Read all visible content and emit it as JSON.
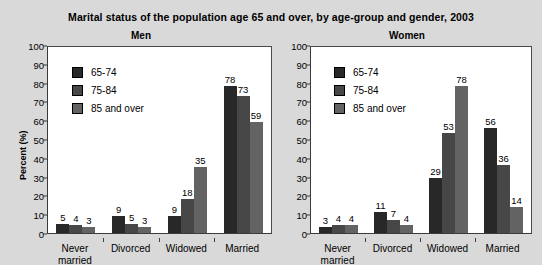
{
  "chart_data": {
    "type": "bar",
    "title": "Marital status of the population age 65 and over, by age-group and gender, 2003",
    "xlabel": "",
    "ylabel": "Percent (%)",
    "ylim": [
      0,
      100
    ],
    "ytick_step": 10,
    "yticks": [
      0,
      10,
      20,
      30,
      40,
      50,
      60,
      70,
      80,
      90,
      100
    ],
    "ytick_labels": [
      "0",
      "10",
      "20",
      "30",
      "40",
      "50",
      "60",
      "70",
      "80",
      "90",
      "100"
    ],
    "grid": false,
    "legend_position": "upper-left inside plot",
    "legend_entries": [
      "65-74",
      "75-84",
      "85 and over"
    ],
    "series_colors": [
      "#282828",
      "#474747",
      "#636363"
    ],
    "categories": [
      "Never married",
      "Divorced",
      "Widowed",
      "Married"
    ],
    "category_label_lines": [
      [
        "Never",
        "married"
      ],
      [
        "Divorced"
      ],
      [
        "Widowed"
      ],
      [
        "Married"
      ]
    ],
    "panels": [
      {
        "name": "men",
        "title": "Men",
        "show_ylabel": true,
        "series": [
          {
            "name": "65-74",
            "values": [
              5,
              9,
              9,
              78
            ]
          },
          {
            "name": "75-84",
            "values": [
              4,
              5,
              18,
              73
            ]
          },
          {
            "name": "85 and over",
            "values": [
              3,
              3,
              35,
              59
            ]
          }
        ]
      },
      {
        "name": "women",
        "title": "Women",
        "show_ylabel": false,
        "series": [
          {
            "name": "65-74",
            "values": [
              3,
              11,
              29,
              56
            ]
          },
          {
            "name": "75-84",
            "values": [
              4,
              7,
              53,
              36
            ]
          },
          {
            "name": "85 and over",
            "values": [
              4,
              4,
              78,
              14
            ]
          }
        ]
      }
    ]
  }
}
